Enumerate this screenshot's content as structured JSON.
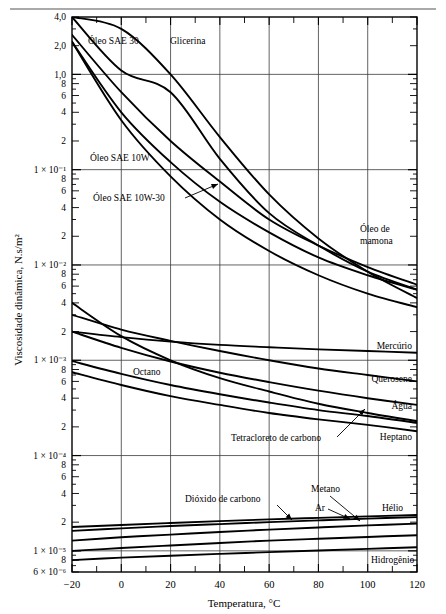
{
  "axes": {
    "y_title": "Viscosidade dinâmica, N.s/m²",
    "x_title": "Temperatura, °C",
    "y_tick_labels": [
      "4,0",
      "2,0",
      "1,0",
      "8",
      "6",
      "4",
      "2",
      "1 × 10⁻¹",
      "8",
      "6",
      "4",
      "2",
      "1 × 10⁻²",
      "8",
      "6",
      "4",
      "2",
      "1 × 10⁻³",
      "8",
      "6",
      "4",
      "2",
      "1 × 10⁻⁴",
      "8",
      "6",
      "4",
      "2",
      "1 × 10⁻⁵",
      "8",
      "6 × 10⁻⁶"
    ],
    "x_tick_labels": [
      "−20",
      "0",
      "20",
      "40",
      "60",
      "80",
      "100",
      "120"
    ]
  },
  "labels": {
    "oleo_sae_30": "Óleo SAE 30",
    "glicerina": "Glicerina",
    "oleo_sae_10w": "Óleo SAE 10W",
    "oleo_sae_10w30": "Óleo SAE 10W-30",
    "oleo_de_mamona_1": "Óleo de",
    "oleo_de_mamona_2": "mamona",
    "mercurio": "Mercúrio",
    "octano": "Octano",
    "querosene": "Querosene",
    "agua": "Água",
    "tetracloreto": "Tetracloreto de carbono",
    "heptano": "Heptano",
    "dioxido": "Dióxido de carbono",
    "metano": "Metano",
    "ar": "Ar",
    "helio": "Hélio",
    "hidrogenio": "Hidrogênio"
  },
  "chart_data": {
    "type": "line",
    "title": "",
    "xlabel": "Temperatura, °C",
    "ylabel": "Viscosidade dinâmica, N.s/m²",
    "xlim": [
      -20,
      120
    ],
    "ylim": [
      6e-06,
      4.0
    ],
    "yscale": "log",
    "xscale": "linear",
    "grid": true,
    "legend": "inline-annotations",
    "x_ticks": [
      -20,
      0,
      20,
      40,
      60,
      80,
      100,
      120
    ],
    "x_minor_step": 10,
    "series": [
      {
        "name": "Óleo de mamona",
        "x": [
          -20,
          0,
          20,
          40,
          60,
          80,
          100,
          120
        ],
        "y": [
          4.0,
          1.1,
          0.65,
          0.13,
          0.035,
          0.016,
          0.0085,
          0.0055
        ]
      },
      {
        "name": "Glicerina",
        "x": [
          -20,
          0,
          20,
          40,
          60,
          80,
          100,
          120
        ],
        "y": [
          4.0,
          3.0,
          1.0,
          0.22,
          0.055,
          0.019,
          0.0085,
          0.0045
        ]
      },
      {
        "name": "Óleo SAE 30",
        "x": [
          -20,
          0,
          20,
          40,
          60,
          80,
          100,
          120
        ],
        "y": [
          2.6,
          0.65,
          0.2,
          0.075,
          0.03,
          0.016,
          0.0095,
          0.0062
        ]
      },
      {
        "name": "Óleo SAE 10W-30",
        "x": [
          -20,
          0,
          20,
          40,
          60,
          80,
          100,
          120
        ],
        "y": [
          2.2,
          0.4,
          0.12,
          0.046,
          0.022,
          0.012,
          0.0078,
          0.0055
        ]
      },
      {
        "name": "Óleo SAE 10W",
        "x": [
          -20,
          0,
          20,
          40,
          60,
          80,
          100,
          120
        ],
        "y": [
          2.2,
          0.33,
          0.085,
          0.03,
          0.014,
          0.0078,
          0.005,
          0.0036
        ]
      },
      {
        "name": "Mercúrio",
        "x": [
          -20,
          0,
          20,
          40,
          60,
          80,
          100,
          120
        ],
        "y": [
          0.002,
          0.00175,
          0.00157,
          0.00145,
          0.00137,
          0.0013,
          0.00125,
          0.0012
        ]
      },
      {
        "name": "Água",
        "x": [
          -20,
          0,
          20,
          40,
          60,
          80,
          100,
          120
        ],
        "y": [
          0.004,
          0.00179,
          0.001,
          0.00065,
          0.00047,
          0.00035,
          0.00028,
          0.00023
        ]
      },
      {
        "name": "Tetracloreto de carbono",
        "x": [
          -20,
          0,
          20,
          40,
          60,
          80,
          100,
          120
        ],
        "y": [
          0.002,
          0.00135,
          0.00097,
          0.00074,
          0.00059,
          0.00048,
          0.0004,
          0.00034
        ]
      },
      {
        "name": "Querosene",
        "x": [
          -20,
          0,
          20,
          40,
          60,
          80,
          100,
          120
        ],
        "y": [
          0.003,
          0.0021,
          0.0016,
          0.00125,
          0.001,
          0.00082,
          0.0007,
          0.0006
        ]
      },
      {
        "name": "Octano",
        "x": [
          -20,
          0,
          20,
          40,
          60,
          80,
          100,
          120
        ],
        "y": [
          0.00098,
          0.00072,
          0.00055,
          0.00044,
          0.00036,
          0.0003,
          0.00026,
          0.00022
        ]
      },
      {
        "name": "Heptano",
        "x": [
          -20,
          0,
          20,
          40,
          60,
          80,
          100,
          120
        ],
        "y": [
          0.00075,
          0.00055,
          0.00042,
          0.00034,
          0.00028,
          0.00024,
          0.00021,
          0.00018
        ]
      },
      {
        "name": "Hélio",
        "x": [
          -20,
          0,
          20,
          40,
          60,
          80,
          100,
          120
        ],
        "y": [
          1.78e-05,
          1.87e-05,
          1.96e-05,
          2.05e-05,
          2.14e-05,
          2.22e-05,
          2.3e-05,
          2.38e-05
        ]
      },
      {
        "name": "Ar",
        "x": [
          -20,
          0,
          20,
          40,
          60,
          80,
          100,
          120
        ],
        "y": [
          1.62e-05,
          1.72e-05,
          1.82e-05,
          1.91e-05,
          2e-05,
          2.09e-05,
          2.18e-05,
          2.26e-05
        ]
      },
      {
        "name": "Metano",
        "x": [
          -20,
          0,
          20,
          40,
          60,
          80,
          100,
          120
        ],
        "y": [
          1e-05,
          1.07e-05,
          1.14e-05,
          1.21e-05,
          1.28e-05,
          1.34e-05,
          1.4e-05,
          1.46e-05
        ]
      },
      {
        "name": "Dióxido de carbono",
        "x": [
          -20,
          0,
          20,
          40,
          60,
          80,
          100,
          120
        ],
        "y": [
          1.28e-05,
          1.39e-05,
          1.48e-05,
          1.58e-05,
          1.67e-05,
          1.76e-05,
          1.85e-05,
          1.93e-05
        ]
      },
      {
        "name": "Hidrogênio",
        "x": [
          -20,
          0,
          20,
          40,
          60,
          80,
          100,
          120
        ],
        "y": [
          8e-06,
          8.5e-06,
          8.9e-06,
          9.3e-06,
          9.7e-06,
          1.01e-05,
          1.05e-05,
          1.09e-05
        ]
      }
    ]
  }
}
